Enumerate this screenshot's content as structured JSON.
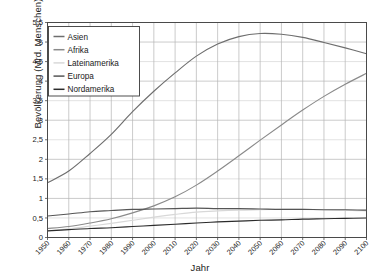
{
  "chart_data": {
    "type": "line",
    "title": "",
    "xlabel": "Jahr",
    "ylabel": "Bevölkerung (Mrd. Menschen)",
    "xlim": [
      1950,
      2100
    ],
    "ylim": [
      0,
      5.5
    ],
    "xticks": [
      1950,
      1960,
      1970,
      1980,
      1990,
      2000,
      2010,
      2020,
      2030,
      2040,
      2050,
      2060,
      2070,
      2080,
      2090,
      2100
    ],
    "xticklabels": [
      "1950",
      "1960",
      "1970",
      "1980",
      "1990",
      "2000",
      "2010",
      "2020",
      "2030",
      "2040",
      "2050",
      "2060",
      "2070",
      "2080",
      "2090",
      "2100"
    ],
    "yticks": [
      0,
      0.5,
      1,
      1.5,
      2,
      2.5,
      3,
      3.5,
      4,
      4.5,
      5,
      5.5
    ],
    "yticklabels": [
      "0",
      "0,5",
      "1",
      "1,5",
      "2",
      "2,5",
      "3",
      "3,5",
      "4",
      "4,5",
      "5",
      "5,5"
    ],
    "grid": true,
    "legend_position": "upper-left",
    "x": [
      1950,
      1960,
      1970,
      1980,
      1990,
      2000,
      2010,
      2020,
      2030,
      2040,
      2050,
      2060,
      2070,
      2080,
      2090,
      2100
    ],
    "series": [
      {
        "name": "Asien",
        "color": "#6e6e6e",
        "values": [
          1.4,
          1.7,
          2.15,
          2.64,
          3.22,
          3.74,
          4.21,
          4.64,
          4.95,
          5.14,
          5.22,
          5.2,
          5.12,
          4.99,
          4.85,
          4.7
        ]
      },
      {
        "name": "Afrika",
        "color": "#8a8a8a",
        "values": [
          0.23,
          0.28,
          0.37,
          0.48,
          0.63,
          0.81,
          1.04,
          1.34,
          1.7,
          2.09,
          2.49,
          2.88,
          3.26,
          3.61,
          3.92,
          4.2
        ]
      },
      {
        "name": "Lateinamerika",
        "color": "#d8d8d8",
        "values": [
          0.17,
          0.22,
          0.29,
          0.36,
          0.44,
          0.52,
          0.59,
          0.65,
          0.68,
          0.7,
          0.71,
          0.72,
          0.72,
          0.71,
          0.7,
          0.68
        ]
      },
      {
        "name": "Europa",
        "color": "#555555",
        "values": [
          0.55,
          0.6,
          0.66,
          0.69,
          0.72,
          0.73,
          0.74,
          0.75,
          0.74,
          0.74,
          0.73,
          0.72,
          0.72,
          0.71,
          0.71,
          0.7
        ]
      },
      {
        "name": "Nordamerika",
        "color": "#2b2b2b",
        "values": [
          0.17,
          0.2,
          0.23,
          0.25,
          0.28,
          0.31,
          0.34,
          0.37,
          0.4,
          0.42,
          0.44,
          0.45,
          0.47,
          0.48,
          0.49,
          0.5
        ]
      }
    ]
  }
}
